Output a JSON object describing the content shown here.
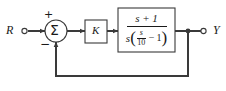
{
  "figure": {
    "type": "control-system-block-diagram",
    "background_color": "#ffffff",
    "line_color": "#3a3a3a",
    "text_color": "#1a1a1a"
  },
  "nodes": {
    "input_terminal": {
      "label": "R",
      "marker": "open-circle",
      "x": 23,
      "y": 31
    },
    "summing_junction": {
      "glyph": "Σ",
      "shape": "circle",
      "cx": 56,
      "cy": 31,
      "r": 11,
      "signs": {
        "reference_input": "+",
        "feedback_input": "−"
      }
    },
    "gain_block": {
      "label": "K",
      "x": 85,
      "y": 20,
      "width": 22,
      "height": 23
    },
    "plant_block": {
      "transfer_function": "(s + 1) / (s(s/10 - 1))",
      "numerator": "s + 1",
      "denominator_leading": "s",
      "denominator_inner_fraction_numerator": "s",
      "denominator_inner_fraction_denominator": "10",
      "denominator_operator": "−",
      "denominator_constant": "1",
      "x": 118,
      "y": 8,
      "width": 57,
      "height": 44
    },
    "output_junction": {
      "marker": "filled-dot",
      "x": 188,
      "y": 31
    },
    "output_terminal": {
      "label": "Y",
      "marker": "open-circle",
      "x": 205,
      "y": 31
    }
  },
  "edges": [
    {
      "name": "input-to-sum",
      "from": "R",
      "to": "summing-junction"
    },
    {
      "name": "sum-to-gain",
      "from": "summing-junction",
      "to": "gain-block"
    },
    {
      "name": "gain-to-plant",
      "from": "gain-block",
      "to": "plant-block"
    },
    {
      "name": "plant-to-output",
      "from": "plant-block",
      "to": "Y"
    },
    {
      "name": "feedback-path",
      "from": "output-junction",
      "to": "summing-junction",
      "y": 76
    }
  ]
}
